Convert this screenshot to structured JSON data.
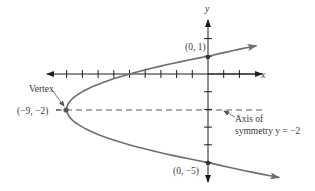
{
  "figure": {
    "type": "parabola-graph",
    "equation_form": "x = (y + 2)^2 - 9",
    "axes": {
      "x_label": "x",
      "y_label": "y",
      "x_ticks": [
        -9,
        -8,
        -7,
        -6,
        -5,
        -4,
        -3,
        -2,
        -1,
        1,
        2
      ],
      "y_ticks": [
        2,
        1,
        -1,
        -2,
        -3,
        -4,
        -5
      ]
    },
    "points": [
      {
        "name": "vertex",
        "x": -9,
        "y": -2,
        "label": "(−9, −2)"
      },
      {
        "name": "y-intercept-top",
        "x": 0,
        "y": 1,
        "label": "(0, 1)"
      },
      {
        "name": "y-intercept-bottom",
        "x": 0,
        "y": -5,
        "label": "(0, −5)"
      }
    ],
    "annotations": {
      "vertex_label": "Vertex",
      "axis_label_line1": "Axis of",
      "axis_label_line2": "symmetry y = −2"
    },
    "colors": {
      "curve": "#6e6e6e",
      "axes": "#2a2a2a",
      "dashed": "#5a5a5a",
      "text": "#3a3a3a",
      "point": "#333333"
    }
  }
}
